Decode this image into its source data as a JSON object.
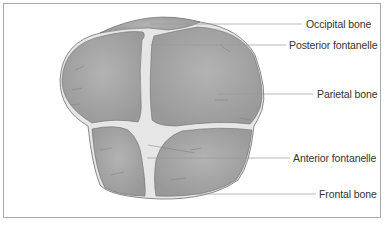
{
  "figure": {
    "labels": [
      {
        "id": "occipital-bone",
        "text": "Occipital bone",
        "x": 306,
        "y": 19
      },
      {
        "id": "posterior-fontanelle",
        "text": "Posterior fontanelle",
        "x": 289,
        "y": 40
      },
      {
        "id": "parietal-bone",
        "text": "Parietal bone",
        "x": 317,
        "y": 88
      },
      {
        "id": "anterior-fontanelle",
        "text": "Anterior fontanelle",
        "x": 293,
        "y": 152
      },
      {
        "id": "frontal-bone",
        "text": "Frontal bone",
        "x": 319,
        "y": 188
      }
    ],
    "colors": {
      "bone_fill": "#a7a7a7",
      "bone_stroke": "#6f6f6f",
      "fontanelle_fill": "#e8e8e8",
      "leader_line": "#9a9a9a",
      "frame": "#a9a9a9"
    }
  }
}
